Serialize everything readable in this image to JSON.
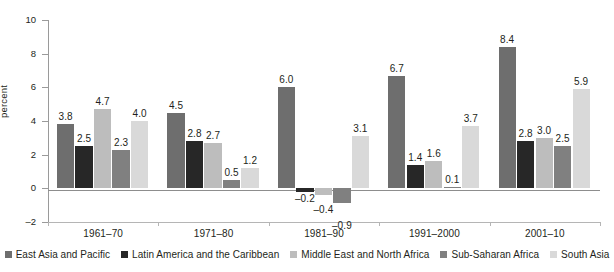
{
  "chart_data": {
    "type": "bar",
    "title": "",
    "subtitle": "",
    "xlabel": "",
    "ylabel": "percent",
    "ylim": [
      -2,
      10
    ],
    "yticks": [
      -2,
      0,
      2,
      4,
      6,
      8,
      10
    ],
    "ytick_labels": [
      "–2",
      "0",
      "2",
      "4",
      "6",
      "8",
      "10"
    ],
    "grid": false,
    "legend_position": "bottom",
    "categories": [
      "1961–70",
      "1971–80",
      "1981–90",
      "1991–2000",
      "2001–10"
    ],
    "series": [
      {
        "name": "East Asia and Pacific",
        "color": "#6e6e6e",
        "values": [
          3.8,
          4.5,
          6.0,
          6.7,
          8.4
        ],
        "labels": [
          "3.8",
          "4.5",
          "6.0",
          "6.7",
          "8.4"
        ]
      },
      {
        "name": "Latin America and the Caribbean",
        "color": "#272727",
        "values": [
          2.5,
          2.8,
          -0.2,
          1.4,
          2.8
        ],
        "labels": [
          "2.5",
          "2.8",
          "–0.2",
          "1.4",
          "2.8"
        ]
      },
      {
        "name": "Middle East and North Africa",
        "color": "#bdbdbd",
        "values": [
          4.7,
          2.7,
          -0.4,
          1.6,
          3.0
        ],
        "labels": [
          "4.7",
          "2.7",
          "–0.4",
          "1.6",
          "3.0"
        ]
      },
      {
        "name": "Sub-Saharan Africa",
        "color": "#808080",
        "values": [
          2.3,
          0.5,
          -0.9,
          0.1,
          2.5
        ],
        "labels": [
          "2.3",
          "0.5",
          "–0.9",
          "0.1",
          "2.5"
        ]
      },
      {
        "name": "South Asia",
        "color": "#d9d9d9",
        "values": [
          4.0,
          1.2,
          3.1,
          3.7,
          5.9
        ],
        "labels": [
          "4.0",
          "1.2",
          "3.1",
          "3.7",
          "5.9"
        ]
      }
    ]
  }
}
